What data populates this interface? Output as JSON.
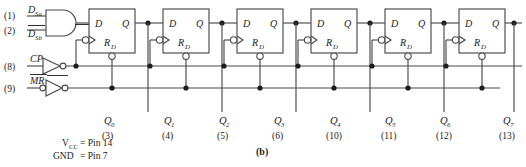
{
  "figure": {
    "caption": "(b)",
    "type": "logic-schematic"
  },
  "inputs": [
    {
      "pin": "(1)",
      "label": "D",
      "sub": "Sa",
      "overbar": false,
      "gate": "and"
    },
    {
      "pin": "(2)",
      "label": "D",
      "sub": "Sb",
      "overbar": true,
      "gate": "and"
    },
    {
      "pin": "(8)",
      "label": "CP",
      "sub": "",
      "overbar": false,
      "gate": "inverter"
    },
    {
      "pin": "(9)",
      "label": "MR",
      "sub": "",
      "overbar": true,
      "gate": "inverter-bubble-in"
    }
  ],
  "flipflops": [
    {
      "index": 0,
      "d_label": "D",
      "q_label": "Q",
      "reset_label": "R",
      "reset_sub": "D"
    },
    {
      "index": 1,
      "d_label": "D",
      "q_label": "Q",
      "reset_label": "R",
      "reset_sub": "D"
    },
    {
      "index": 2,
      "d_label": "D",
      "q_label": "Q",
      "reset_label": "R",
      "reset_sub": "D"
    },
    {
      "index": 3,
      "d_label": "D",
      "q_label": "Q",
      "reset_label": "R",
      "reset_sub": "D"
    },
    {
      "index": 4,
      "d_label": "D",
      "q_label": "Q",
      "reset_label": "R",
      "reset_sub": "D"
    },
    {
      "index": 5,
      "d_label": "D",
      "q_label": "Q",
      "reset_label": "R",
      "reset_sub": "D"
    },
    {
      "index": 6,
      "d_label": "D",
      "q_label": "Q",
      "reset_label": "R",
      "reset_sub": "D"
    },
    {
      "index": 7,
      "d_label": "D",
      "q_label": "Q",
      "reset_label": "R",
      "reset_sub": "D"
    }
  ],
  "outputs": [
    {
      "label": "Q",
      "sub": "0",
      "pin": "(3)"
    },
    {
      "label": "Q",
      "sub": "1",
      "pin": "(4)"
    },
    {
      "label": "Q",
      "sub": "2",
      "pin": "(5)"
    },
    {
      "label": "Q",
      "sub": "3",
      "pin": "(6)"
    },
    {
      "label": "Q",
      "sub": "4",
      "pin": "(10)"
    },
    {
      "label": "Q",
      "sub": "5",
      "pin": "(11)"
    },
    {
      "label": "Q",
      "sub": "6",
      "pin": "(12)"
    },
    {
      "label": "Q",
      "sub": "7",
      "pin": "(13)"
    }
  ],
  "power_notes": [
    {
      "label": "V",
      "sub": "CC",
      "value": "= Pin 14"
    },
    {
      "label": "GND",
      "sub": "",
      "value": "= Pin 7"
    }
  ],
  "colors": {
    "wire": "#4a4a4a",
    "text": "#1c1c1c",
    "background": "#ffffff"
  }
}
